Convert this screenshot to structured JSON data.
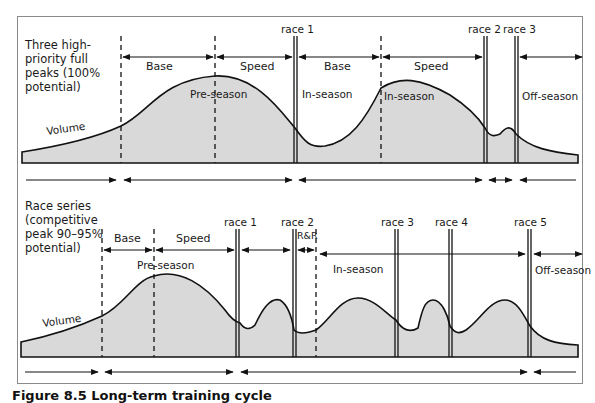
{
  "figure": {
    "caption": "Figure 8.5 Long-term training cycle"
  },
  "panels": [
    {
      "id": "full-peaks",
      "description_lines": [
        "Three high-",
        "priority full",
        "peaks (100%",
        "potential)"
      ],
      "volume_label": "Volume",
      "phase_labels": {
        "pre_season": "Pre-season",
        "in_season_1": "In-season",
        "in_season_2": "In-season",
        "off_season": "Off-season"
      },
      "segment_labels": [
        "Base",
        "Speed",
        "Base",
        "Speed"
      ],
      "races": [
        "race 1",
        "race 2",
        "race 3"
      ]
    },
    {
      "id": "race-series",
      "description_lines": [
        "Race series",
        "(competitive",
        "peak 90–95%",
        "potential)"
      ],
      "volume_label": "Volume",
      "phase_labels": {
        "pre_season": "Pre-season",
        "in_season": "In-season",
        "off_season": "Off-season"
      },
      "segment_labels": [
        "Base",
        "Speed",
        "R&R"
      ],
      "races": [
        "race 1",
        "race 2",
        "race 3",
        "race 4",
        "race 5"
      ]
    }
  ],
  "colors": {
    "fill": "#d9d9d9",
    "stroke": "#111111",
    "frame": "#8a8a8a"
  }
}
